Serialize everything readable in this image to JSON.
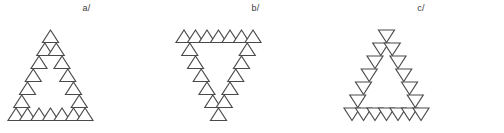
{
  "figure": {
    "background_color": "#ffffff",
    "stroke_color": "#4a4a4a",
    "fill_color": "#ffffff",
    "label_color": "#3a3a3a",
    "width": 504,
    "height": 133
  },
  "panels": [
    {
      "id": "a",
      "label": "a/",
      "marker": "up-triangle",
      "shape": "upward triangle outline",
      "marker_count": 18,
      "marker_size": 13,
      "rows": 7,
      "base_count": 7
    },
    {
      "id": "b",
      "label": "b/",
      "marker": "up-triangle",
      "shape": "downward triangle outline",
      "marker_count": 18,
      "marker_size": 13,
      "rows": 7,
      "base_count": 7
    },
    {
      "id": "c",
      "label": "c/",
      "marker": "down-triangle",
      "shape": "upward triangle outline",
      "marker_count": 18,
      "marker_size": 13,
      "rows": 7,
      "base_count": 7
    }
  ],
  "geometry": {
    "rows": 7,
    "step_x": 11.5,
    "step_y": 13.0,
    "origin_x": 16,
    "origin_y": 12,
    "marker_half_width": 8.0,
    "marker_height": 12.5
  }
}
